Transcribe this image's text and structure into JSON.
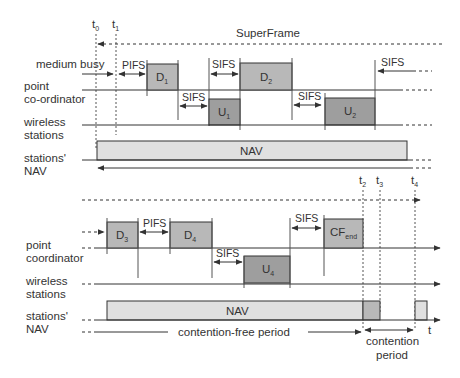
{
  "title": "SuperFrame",
  "colors": {
    "downlink_fill": "#b8b8b8",
    "uplink_fill": "#9e9e9e",
    "nav_fill": "#e0e0e0",
    "line": "#333333"
  },
  "time_markers": {
    "t0": "t",
    "t0_sub": "0",
    "t1": "t",
    "t1_sub": "1",
    "t2": "t",
    "t2_sub": "2",
    "t3": "t",
    "t3_sub": "3",
    "t4": "t",
    "t4_sub": "4",
    "t_axis": "t"
  },
  "top_panel": {
    "rows": {
      "medium_busy": "medium busy",
      "point_coordinator_1": "point",
      "point_coordinator_2": "co-ordinator",
      "wireless_1": "wireless",
      "wireless_2": "stations",
      "nav_1": "stations'",
      "nav_2": "NAV"
    },
    "frames": {
      "d1": "D",
      "d1_sub": "1",
      "d2": "D",
      "d2_sub": "2",
      "u1": "U",
      "u1_sub": "1",
      "u2": "U",
      "u2_sub": "2",
      "nav": "NAV"
    },
    "gaps": {
      "pifs": "PIFS",
      "sifs_a": "SIFS",
      "sifs_b": "SIFS",
      "sifs_c": "SIFS",
      "sifs_d": "SIFS"
    }
  },
  "bottom_panel": {
    "rows": {
      "point_coordinator_1": "point",
      "point_coordinator_2": "coordinator",
      "wireless_1": "wireless",
      "wireless_2": "stations",
      "nav_1": "stations'",
      "nav_2": "NAV"
    },
    "frames": {
      "d3": "D",
      "d3_sub": "3",
      "d4": "D",
      "d4_sub": "4",
      "u4": "U",
      "u4_sub": "4",
      "cf_end": "CF",
      "cf_end_sub": "end",
      "nav": "NAV"
    },
    "gaps": {
      "pifs": "PIFS",
      "sifs_a": "SIFS",
      "sifs_b": "SIFS"
    },
    "periods": {
      "contention_free": "contention-free period",
      "contention_1": "contention",
      "contention_2": "period"
    }
  }
}
